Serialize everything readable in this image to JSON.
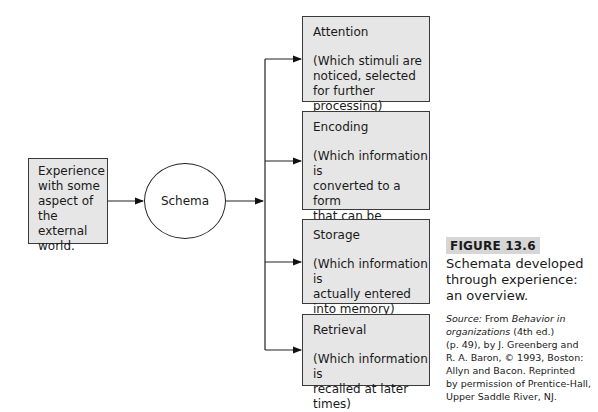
{
  "diagram": {
    "input": {
      "label": "Experience\nwith some\naspect of\nthe external\nworld."
    },
    "schema": {
      "label": "Schema"
    },
    "stages": [
      {
        "title": "Attention",
        "description": "(Which stimuli are\nnoticed, selected\nfor further processing)"
      },
      {
        "title": "Encoding",
        "description": "(Which information is\nconverted to a form\nthat can be entered\ninto memory)"
      },
      {
        "title": "Storage",
        "description": "(Which information is\nactually entered\ninto memory)"
      },
      {
        "title": "Retrieval",
        "description": "(Which information is\nrecalled at later times)"
      }
    ]
  },
  "caption": {
    "figure_label": "FIGURE 13.6",
    "title": "Schemata developed\nthrough experience:\nan overview.",
    "source_prefix": "Source:",
    "source_from": " From ",
    "source_book": "Behavior in\norganizations",
    "source_rest": " (4th ed.)\n(p. 49), by J. Greenberg and\nR. A. Baron, © 1993, Boston:\nAllyn and Bacon. Reprinted\nby permission of Prentice-Hall,\nUpper Saddle River, NJ."
  }
}
